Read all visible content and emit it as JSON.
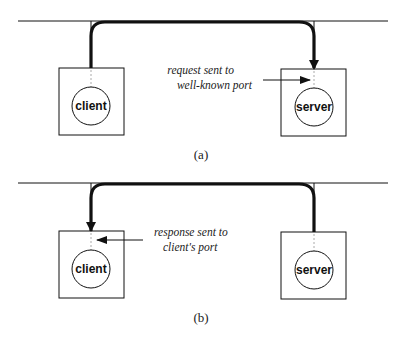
{
  "panels": [
    {
      "id": "a",
      "caption": "(a)",
      "client_label": "client",
      "server_label": "server",
      "annotation_line1": "request sent to",
      "annotation_line2": "well-known port",
      "direction": "client-to-server"
    },
    {
      "id": "b",
      "caption": "(b)",
      "client_label": "client",
      "server_label": "server",
      "annotation_line1": "response sent to",
      "annotation_line2": "client's port",
      "direction": "server-to-client"
    }
  ],
  "colors": {
    "line": "#111111",
    "port": "#aaaaaa",
    "background": "#ffffff"
  }
}
